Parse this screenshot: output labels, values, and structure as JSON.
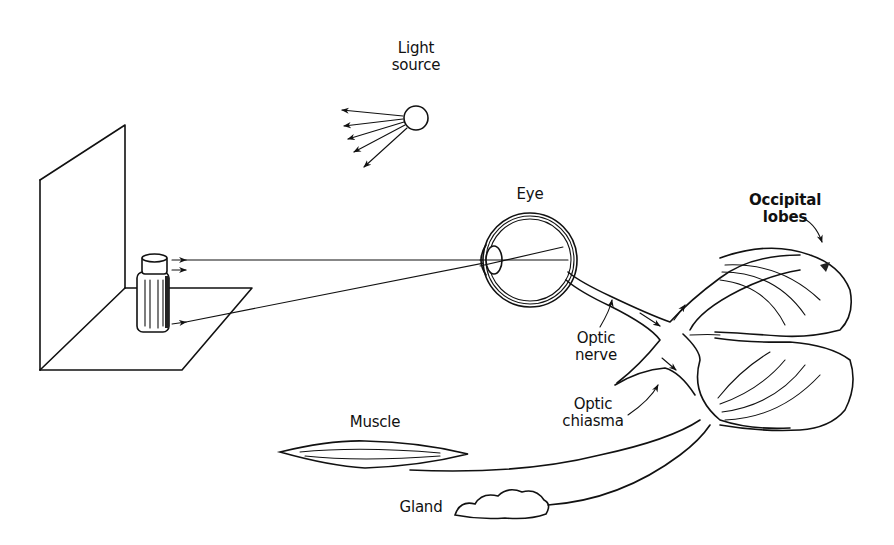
{
  "diagram": {
    "type": "illustration",
    "labels": {
      "light_source": [
        "Light",
        "source"
      ],
      "eye": "Eye",
      "occipital_lobes": [
        "Occipital",
        "lobes"
      ],
      "optic_nerve": [
        "Optic",
        "nerve"
      ],
      "optic_chiasma": [
        "Optic",
        "chiasma"
      ],
      "muscle": "Muscle",
      "gland": "Gland"
    },
    "elements": [
      {
        "id": "light-source",
        "shape": "circle",
        "rays": 5
      },
      {
        "id": "screen-and-floor",
        "shape": "perspective planes"
      },
      {
        "id": "bottle",
        "shape": "cylinder object"
      },
      {
        "id": "eye",
        "shape": "eyeball cross-section"
      },
      {
        "id": "optic-nerve",
        "shape": "nerve tract"
      },
      {
        "id": "optic-chiasma",
        "shape": "crossing tract"
      },
      {
        "id": "occipital-lobes",
        "shape": "two brain lobes"
      },
      {
        "id": "muscle",
        "shape": "spindle"
      },
      {
        "id": "gland",
        "shape": "lobulated blob"
      }
    ],
    "connections": [
      {
        "from": "bottle",
        "to": "eye",
        "kind": "light ray (top)"
      },
      {
        "from": "bottle",
        "to": "eye",
        "kind": "light ray (bottom, crossing at lens)"
      },
      {
        "from": "eye",
        "to": "optic-chiasma",
        "kind": "optic nerve"
      },
      {
        "from": "optic-chiasma",
        "to": "occipital-lobes",
        "kind": "optic tracts"
      },
      {
        "from": "occipital-lobes",
        "to": "muscle",
        "kind": "efferent pathway"
      },
      {
        "from": "occipital-lobes",
        "to": "gland",
        "kind": "efferent pathway"
      }
    ],
    "colors": {
      "ink": "#111111",
      "background": "#ffffff"
    }
  }
}
